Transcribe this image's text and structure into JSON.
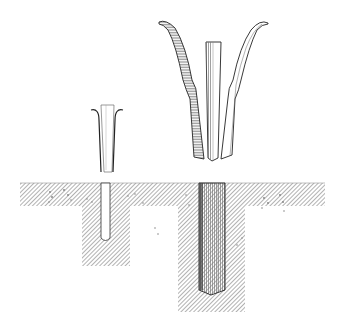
{
  "figure": {
    "type": "technical-illustration",
    "background": "#ffffff",
    "ink_color": "#222222",
    "hatch_color": "#555555",
    "components": [
      {
        "name": "small-anchor",
        "parts": [
          "small-wedge-core",
          "small-left-leaf",
          "small-right-leaf"
        ]
      },
      {
        "name": "large-anchor",
        "parts": [
          "large-wedge-core",
          "large-left-leaf",
          "large-right-leaf"
        ]
      },
      {
        "name": "ground-slab"
      },
      {
        "name": "small-hole-block",
        "contains": "small-anchored-rod"
      },
      {
        "name": "large-hole-block",
        "contains": "large-anchored-rod"
      }
    ]
  }
}
